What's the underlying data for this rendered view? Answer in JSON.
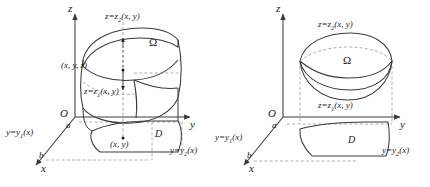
{
  "figure": {
    "background_color": "#ffffff",
    "stroke_color": "#3a3a3a",
    "dash_color": "#8a8a8a",
    "width": 430,
    "height": 187
  },
  "left_panel": {
    "name": "left-diagram",
    "axes": {
      "z_label": "z",
      "y_label": "y",
      "x_label": "x",
      "origin_label": "O"
    },
    "marks": {
      "a_label": "a",
      "b_label": "b"
    },
    "labels": {
      "top_surface": "z=z",
      "top_surface_sub": "2",
      "top_surface_args": "(x, y)",
      "bottom_surface": "z=z",
      "bottom_surface_sub": "1",
      "bottom_surface_args": "(x, y)",
      "solid_region": "Ω",
      "base_region": "D",
      "point_3d": "(x, y, z)",
      "point_2d": "(x, y)",
      "curve_y1": "y=y",
      "curve_y1_sub": "1",
      "curve_y1_args": "(x)",
      "curve_y2": "y=y",
      "curve_y2_sub": "2",
      "curve_y2_args": "(x)"
    }
  },
  "right_panel": {
    "name": "right-diagram",
    "axes": {
      "z_label": "z",
      "y_label": "y",
      "x_label": "x",
      "origin_label": "O"
    },
    "marks": {
      "a_label": "a",
      "b_label": "b"
    },
    "labels": {
      "top_surface": "z=z",
      "top_surface_sub": "2",
      "top_surface_args": "(x, y)",
      "bottom_surface": "z=z",
      "bottom_surface_sub": "1",
      "bottom_surface_args": "(x, y)",
      "solid_region": "Ω",
      "base_region": "D",
      "curve_y1": "y=y",
      "curve_y1_sub": "1",
      "curve_y1_args": "(x)",
      "curve_y2": "y=y",
      "curve_y2_sub": "2",
      "curve_y2_args": "(x)"
    }
  }
}
